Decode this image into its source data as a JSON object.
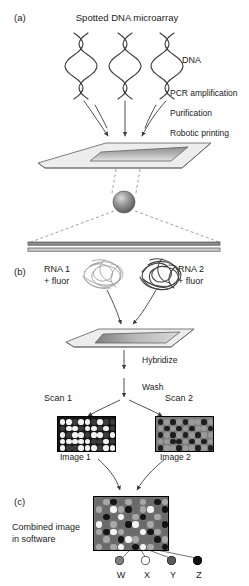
{
  "figure": {
    "panels": {
      "a": "(a)",
      "b": "(b)",
      "c": "(c)"
    },
    "titles": {
      "main": "Spotted DNA microarray"
    },
    "panel_a": {
      "dna_label": "DNA",
      "steps": [
        "PCR amplification",
        "Purification",
        "Robotic printing"
      ]
    },
    "panel_b": {
      "rna1_line1": "RNA 1",
      "rna1_line2": "+ fluor",
      "rna2_line1": "RNA 2",
      "rna2_line2": "+ fluor",
      "hybridize": "Hybridize",
      "wash": "Wash",
      "scan1": "Scan 1",
      "scan2": "Scan 2",
      "image1": "Image 1",
      "image2": "Image 2"
    },
    "panel_c": {
      "caption_line1": "Combined image",
      "caption_line2": "in software",
      "legend": [
        {
          "key": "W",
          "color": "#808080",
          "stroke": "#3a3a3a"
        },
        {
          "key": "X",
          "color": "#ffffff",
          "stroke": "#3a3a3a"
        },
        {
          "key": "Y",
          "color": "#5a5a5a",
          "stroke": "#2a2a2a"
        },
        {
          "key": "Z",
          "color": "#111111",
          "stroke": "#000000"
        }
      ]
    },
    "colors": {
      "ink": "#2b2b2b",
      "slide_fill": "#ededed",
      "slide_edge": "#6e6e6e",
      "spot_dark": "#4a4a4a",
      "image1_bg": "#151515",
      "image2_bg": "#7d7d7d",
      "combined_bg": "#6f6f6f"
    },
    "image1_grid": {
      "cols": 9,
      "rows": 5,
      "cells": [
        [
          "w",
          "w",
          "d",
          "w",
          "w",
          "d",
          "w",
          "d",
          "d"
        ],
        [
          "d",
          "w",
          "w",
          "d",
          "w",
          "w",
          "d",
          "w",
          "d"
        ],
        [
          "w",
          "d",
          "w",
          "w",
          "d",
          "w",
          "w",
          "d",
          "w"
        ],
        [
          "w",
          "w",
          "w",
          "w",
          "w",
          "d",
          "d",
          "w",
          "d"
        ],
        [
          "w",
          "d",
          "d",
          "w",
          "w",
          "w",
          "d",
          "w",
          "w"
        ]
      ]
    },
    "image2_grid": {
      "cols": 9,
      "rows": 5,
      "cells": [
        [
          "d",
          "g",
          "d",
          "g",
          "d",
          "g",
          "g",
          "d",
          "g"
        ],
        [
          "g",
          "d",
          "g",
          "d",
          "g",
          "d",
          "g",
          "g",
          "d"
        ],
        [
          "d",
          "g",
          "d",
          "g",
          "d",
          "g",
          "d",
          "g",
          "g"
        ],
        [
          "g",
          "g",
          "d",
          "d",
          "g",
          "d",
          "g",
          "d",
          "g"
        ],
        [
          "d",
          "g",
          "g",
          "d",
          "g",
          "g",
          "d",
          "g",
          "d"
        ]
      ]
    },
    "combined_grid": {
      "cols": 10,
      "rows": 7,
      "cells": [
        [
          "m",
          "l",
          "k",
          "m",
          "l",
          "m",
          "l",
          "m",
          "k",
          "l"
        ],
        [
          "l",
          "m",
          "w",
          "l",
          "k",
          "m",
          "l",
          "w",
          "m",
          "k"
        ],
        [
          "m",
          "k",
          "m",
          "w",
          "m",
          "l",
          "k",
          "m",
          "l",
          "m"
        ],
        [
          "w",
          "m",
          "l",
          "m",
          "k",
          "w",
          "m",
          "l",
          "m",
          "k"
        ],
        [
          "l",
          "k",
          "w",
          "l",
          "m",
          "m",
          "w",
          "k",
          "l",
          "m"
        ],
        [
          "m",
          "l",
          "m",
          "k",
          "w",
          "l",
          "m",
          "m",
          "k",
          "l"
        ],
        [
          "l",
          "m",
          "l",
          "w",
          "m",
          "k",
          "w",
          "l",
          "m",
          "k"
        ]
      ]
    }
  }
}
